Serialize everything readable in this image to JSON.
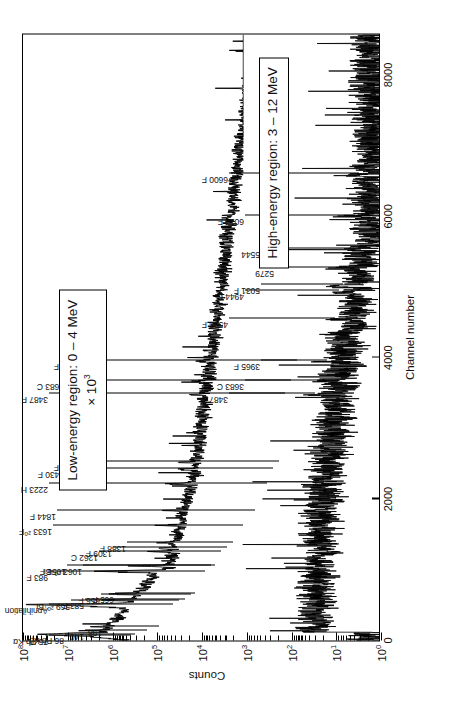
{
  "chart_data": {
    "type": "line",
    "title": "",
    "xlabel": "Channel number",
    "ylabel": "Counts",
    "xlim": [
      0,
      8600
    ],
    "ylim_log": [
      0,
      8
    ],
    "yscale": "log",
    "grid": false,
    "x_ticks": [
      {
        "value": 0,
        "label": "0"
      },
      {
        "value": 2000,
        "label": "2000"
      },
      {
        "value": 4000,
        "label": "4000"
      },
      {
        "value": 6000,
        "label": "6000"
      },
      {
        "value": 8000,
        "label": "8000"
      }
    ],
    "y_ticks": [
      {
        "exp": 8,
        "mantissa": "10",
        "label": "10"
      },
      {
        "exp": 7,
        "mantissa": "10",
        "label": "10"
      },
      {
        "exp": 6,
        "mantissa": "10",
        "label": "10"
      },
      {
        "exp": 5,
        "mantissa": "10",
        "label": "10"
      },
      {
        "exp": 4,
        "mantissa": "10",
        "label": "10"
      },
      {
        "exp": 3,
        "mantissa": "10",
        "label": "10"
      },
      {
        "exp": 2,
        "mantissa": "10",
        "label": "10"
      },
      {
        "exp": 1,
        "mantissa": "10",
        "label": "10"
      },
      {
        "exp": 0,
        "mantissa": "10",
        "label": "10"
      }
    ],
    "regions": [
      {
        "id": "low",
        "text": "Low-energy region: 0 – 4 MeV",
        "scale_text": "× 10",
        "scale_exp": "3"
      },
      {
        "id": "high",
        "text": "High-energy region: 3 – 12 MeV",
        "scale_text": "",
        "scale_exp": ""
      }
    ],
    "peak_labels_low": [
      {
        "label": "75 Pb K",
        "sub": "α",
        "channel": 75
      },
      {
        "label": "86 Pb K",
        "sub": "β",
        "channel": 86
      },
      {
        "label": "140",
        "sub": "",
        "channel": 140
      },
      {
        "label": "198",
        "sub": "",
        "channel": 198
      },
      {
        "label": "Annihilation",
        "sub": "",
        "channel": 511
      },
      {
        "label": "569 ²⁰⁷Bi",
        "sub": "",
        "channel": 569
      },
      {
        "label": "583 F",
        "sub": "",
        "channel": 583
      },
      {
        "label": "656 F",
        "sub": "",
        "channel": 656
      },
      {
        "label": "665 F",
        "sub": "",
        "channel": 665
      },
      {
        "label": "983 F",
        "sub": "",
        "channel": 983
      },
      {
        "label": "1056 F",
        "sub": "",
        "channel": 1056
      },
      {
        "label": "1063 ²⁰⁷Bi",
        "sub": "",
        "channel": 1063
      },
      {
        "label": "1262 C",
        "sub": "",
        "channel": 1262
      },
      {
        "label": "1309 F",
        "sub": "",
        "channel": 1309
      },
      {
        "label": "1388 F",
        "sub": "",
        "channel": 1388
      },
      {
        "label": "1633 ²⁰F",
        "sub": "",
        "channel": 1633
      },
      {
        "label": "1844 F",
        "sub": "",
        "channel": 1844
      },
      {
        "label": "2223 H",
        "sub": "",
        "channel": 2223
      },
      {
        "label": "2430 F",
        "sub": "",
        "channel": 2430
      },
      {
        "label": "2529 F",
        "sub": "",
        "channel": 2529
      },
      {
        "label": "3487 F",
        "sub": "",
        "channel": 3487
      },
      {
        "label": "3683 C",
        "sub": "",
        "channel": 3683
      },
      {
        "label": "3965 F",
        "sub": "",
        "channel": 3965
      }
    ],
    "peak_labels_high": [
      {
        "label": "3487 F",
        "sub": "",
        "channel": 3487
      },
      {
        "label": "3683 C",
        "sub": "",
        "channel": 3683
      },
      {
        "label": "3965 F",
        "sub": "",
        "channel": 3965
      },
      {
        "label": "4555 F",
        "sub": "",
        "channel": 4555
      },
      {
        "label": "4944 C",
        "sub": "",
        "channel": 4944
      },
      {
        "label": "5031 F",
        "sub": "",
        "channel": 5031
      },
      {
        "label": "5279",
        "sub": "",
        "channel": 5279
      },
      {
        "label": "5544",
        "sub": "",
        "channel": 5544
      },
      {
        "label": "6017 F",
        "sub": "",
        "channel": 6017
      },
      {
        "label": "6600 F",
        "sub": "",
        "channel": 6600
      }
    ]
  },
  "axes": {
    "x_title": "Channel number",
    "y_title": "Counts"
  },
  "colors": {
    "ink": "#000000",
    "background": "#ffffff"
  }
}
